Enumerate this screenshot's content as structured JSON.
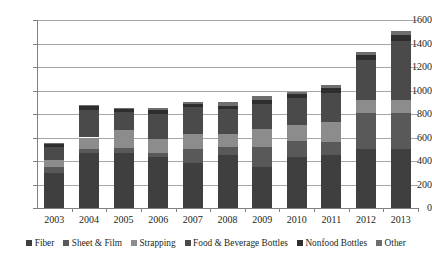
{
  "chart_data": {
    "type": "bar",
    "subtype": "stacked-vertical",
    "title": "",
    "xlabel": "",
    "ylabel": "",
    "ylim": [
      0,
      1600
    ],
    "yticks": [
      0,
      200,
      400,
      600,
      800,
      1000,
      1200,
      1400,
      1600
    ],
    "grid": true,
    "legend_position": "bottom",
    "categories": [
      "2003",
      "2004",
      "2005",
      "2006",
      "2007",
      "2008",
      "2009",
      "2010",
      "2011",
      "2012",
      "2013"
    ],
    "series": [
      {
        "name": "Fiber",
        "color": "#3f3f3f",
        "values": [
          295,
          470,
          470,
          430,
          380,
          455,
          345,
          430,
          450,
          500,
          500
        ]
      },
      {
        "name": "Sheet & Film",
        "color": "#595959",
        "values": [
          55,
          35,
          40,
          40,
          125,
          60,
          175,
          140,
          115,
          310,
          310
        ]
      },
      {
        "name": "Strapping",
        "color": "#8c8c8c",
        "values": [
          55,
          95,
          155,
          120,
          125,
          115,
          150,
          135,
          165,
          110,
          110
        ]
      },
      {
        "name": "Food & Beverage Bottles",
        "color": "#4a4a4a",
        "values": [
          115,
          235,
          155,
          210,
          230,
          210,
          215,
          230,
          250,
          340,
          500
        ]
      },
      {
        "name": "Nonfood Bottles",
        "color": "#2e2e2e",
        "values": [
          25,
          30,
          25,
          30,
          25,
          30,
          35,
          35,
          40,
          45,
          50
        ]
      },
      {
        "name": "Other",
        "color": "#6e6e6e",
        "values": [
          5,
          10,
          10,
          20,
          20,
          30,
          30,
          20,
          25,
          25,
          40
        ]
      }
    ],
    "totals": [
      550,
      875,
      855,
      850,
      905,
      900,
      950,
      990,
      1045,
      1330,
      1510
    ]
  }
}
